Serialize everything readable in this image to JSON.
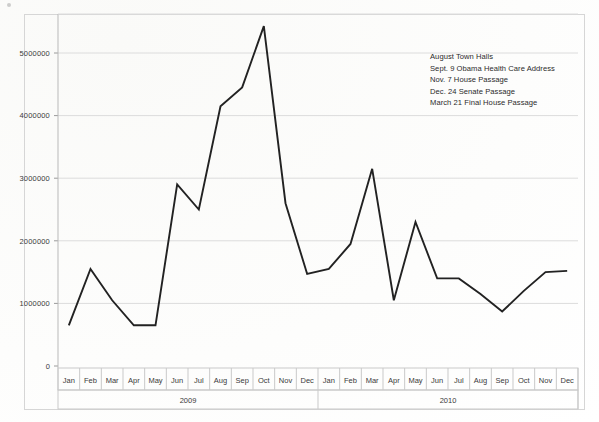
{
  "chart_data": {
    "type": "line",
    "title": "",
    "xlabel": "",
    "ylabel": "",
    "ylim": [
      0,
      5500000
    ],
    "yticks": [
      0,
      1000000,
      2000000,
      3000000,
      4000000,
      5000000
    ],
    "ytick_labels": [
      "0",
      "1000000",
      "2000000",
      "3000000",
      "4000000",
      "5000000"
    ],
    "grid": true,
    "legend_position": "none",
    "categories": [
      "Jan",
      "Feb",
      "Mar",
      "Apr",
      "May",
      "Jun",
      "Jul",
      "Aug",
      "Sep",
      "Oct",
      "Nov",
      "Dec",
      "Jan",
      "Feb",
      "Mar",
      "Apr",
      "May",
      "Jun",
      "Jul",
      "Aug",
      "Sep",
      "Oct",
      "Nov",
      "Dec"
    ],
    "group_labels": [
      "2009",
      "2010"
    ],
    "values": [
      650000,
      1550000,
      1050000,
      650000,
      650000,
      2900000,
      2500000,
      4150000,
      4450000,
      5430000,
      2600000,
      1470000,
      1550000,
      1950000,
      3150000,
      1050000,
      2300000,
      1400000,
      1400000,
      1150000,
      870000,
      1200000,
      1500000,
      1520000
    ],
    "series": [
      {
        "name": "",
        "color": "#222222",
        "values": [
          650000,
          1550000,
          1050000,
          650000,
          650000,
          2900000,
          2500000,
          4150000,
          4450000,
          5430000,
          2600000,
          1470000,
          1550000,
          1950000,
          3150000,
          1050000,
          2300000,
          1400000,
          1400000,
          1150000,
          870000,
          1200000,
          1500000,
          1520000
        ]
      }
    ],
    "annotations": [
      "August Town Halls",
      "Sept. 9 Obama  Health Care Address",
      "Nov. 7 House Passage",
      "Dec. 24 Senate Passage",
      "March 21 Final House Passage"
    ]
  },
  "colors": {
    "line": "#222222",
    "grid": "#dcdcdc",
    "axis": "#b9b9b9",
    "text": "#2b2b2b",
    "frame": "#d6d6d6",
    "background": "#ffffff"
  }
}
